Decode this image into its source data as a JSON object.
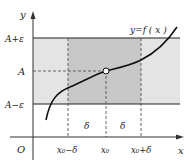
{
  "labels": {
    "y_axis": "y",
    "x_axis": "x",
    "origin": "O",
    "a_plus_eps": "A+ε",
    "a": "A",
    "a_minus_eps": "A−ε",
    "function": "y=f ( x )",
    "x0_minus_delta": "x₀−δ",
    "x0": "x₀",
    "x0_plus_delta": "x₀+δ",
    "delta_left": "δ",
    "delta_right": "δ"
  },
  "colors": {
    "band_light": "#e4e4e4",
    "band_dark": "#c8c8c8",
    "line": "#222222",
    "dash": "#555555"
  }
}
